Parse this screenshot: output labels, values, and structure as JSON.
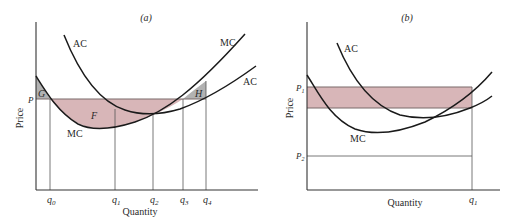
{
  "colors": {
    "surplus_fill": "#d8b6b8",
    "loss_fill": "#b2b2b2",
    "edge": "#7a6a6a",
    "curve": "#1a1a1a"
  },
  "panel_a": {
    "title": "(a)",
    "ylabel": "Price",
    "xlabel": "Quantity",
    "price_label": "P",
    "curve_labels": {
      "ac_left": "AC",
      "mc_right": "MC",
      "ac_right": "AC",
      "mc_bottom": "MC"
    },
    "region_labels": {
      "g": "G",
      "f": "F",
      "h": "H"
    },
    "ticks": [
      "q0",
      "q1",
      "q2",
      "q3",
      "q4"
    ],
    "tick_display": [
      {
        "base": "q",
        "sub": "0"
      },
      {
        "base": "q",
        "sub": "1"
      },
      {
        "base": "q",
        "sub": "2"
      },
      {
        "base": "q",
        "sub": "3"
      },
      {
        "base": "q",
        "sub": "4"
      }
    ]
  },
  "panel_b": {
    "title": "(b)",
    "ylabel": "Price",
    "xlabel": "Quantity",
    "p1_label": {
      "base": "P",
      "sub": "1"
    },
    "p2_label": {
      "base": "P",
      "sub": "2"
    },
    "curve_labels": {
      "ac": "AC",
      "mc": "MC"
    },
    "q_label": {
      "base": "q",
      "sub": "1"
    }
  }
}
